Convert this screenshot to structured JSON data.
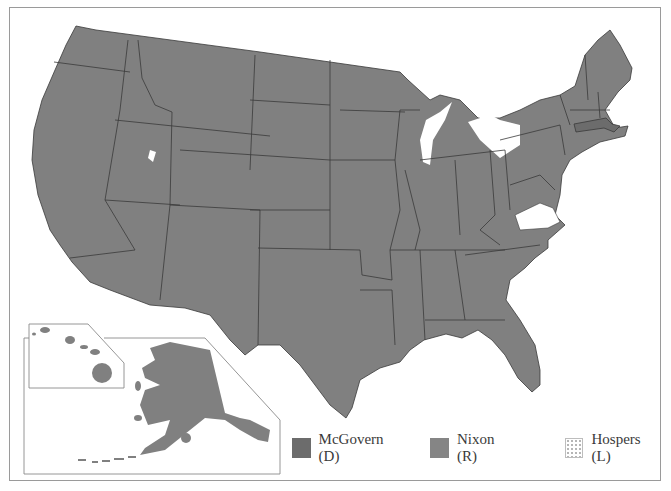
{
  "map": {
    "subject": "1972 U.S. presidential election results by state",
    "colors": {
      "mcgovern": "#6c6c6c",
      "nixon": "#858585",
      "hospers": "#ffffff",
      "state_border": "#3a3a3a",
      "frame": "#9a9a9a"
    },
    "highlighted_states": {
      "mcgovern": [
        "Massachusetts"
      ],
      "hospers": [
        "Virginia (1 electoral vote)"
      ],
      "nixon": [
        "all other states"
      ]
    },
    "inset": [
      "Hawaii",
      "Alaska"
    ]
  },
  "legend": {
    "items": [
      {
        "label": "McGovern (D)",
        "party": "D",
        "color": "#6c6c6c"
      },
      {
        "label": "Nixon (R)",
        "party": "R",
        "color": "#858585"
      },
      {
        "label": "Hospers (L)",
        "party": "L",
        "color": "#ffffff"
      }
    ]
  }
}
